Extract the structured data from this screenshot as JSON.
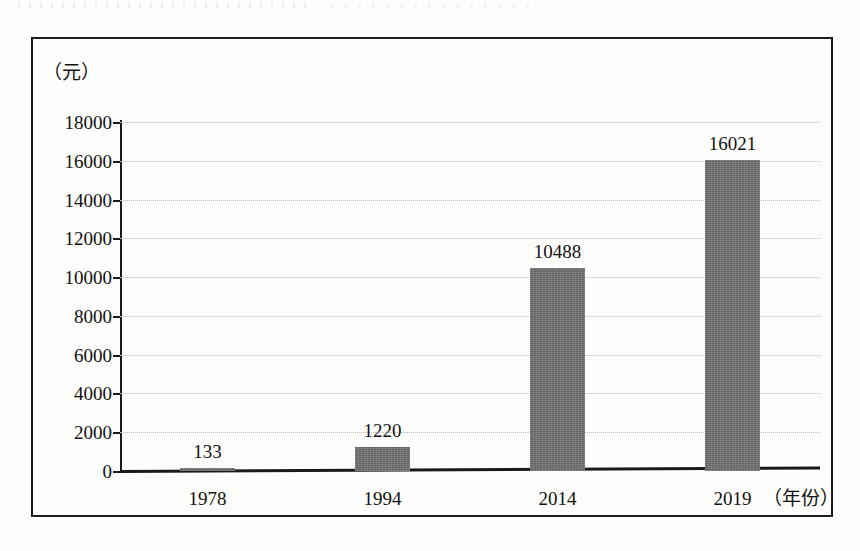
{
  "figure": {
    "y_unit_caption": "（元）",
    "x_axis_caption": "（年份）",
    "frame_color": "#1d1d1d",
    "bar_color": "#6f6f6f",
    "gridline_color": "#b9b9b9",
    "background_color": "#fdfdfb"
  },
  "chart_data": {
    "type": "bar",
    "title": "",
    "subtitle": "",
    "xlabel": "（年份）",
    "ylabel": "（元）",
    "categories": [
      "1978",
      "1994",
      "2014",
      "2019"
    ],
    "values": [
      133,
      1220,
      10488,
      16021
    ],
    "series": [
      {
        "name": "",
        "values": [
          133,
          1220,
          10488,
          16021
        ]
      }
    ],
    "data_labels": [
      "133",
      "1220",
      "10488",
      "16021"
    ],
    "ylim": [
      0,
      18000
    ],
    "ytick_step": 2000,
    "yticks": [
      0,
      2000,
      4000,
      6000,
      8000,
      10000,
      12000,
      14000,
      16000,
      18000
    ],
    "ytick_labels": [
      "0",
      "2000",
      "4000",
      "6000",
      "8000",
      "10000",
      "12000",
      "14000",
      "16000",
      "18000"
    ],
    "xtick_labels": [
      "1978",
      "1994",
      "2014",
      "2019"
    ],
    "grid": true,
    "grid_axis": "y",
    "grid_style": "dotted",
    "legend": false,
    "legend_position": "none",
    "annotations": []
  }
}
